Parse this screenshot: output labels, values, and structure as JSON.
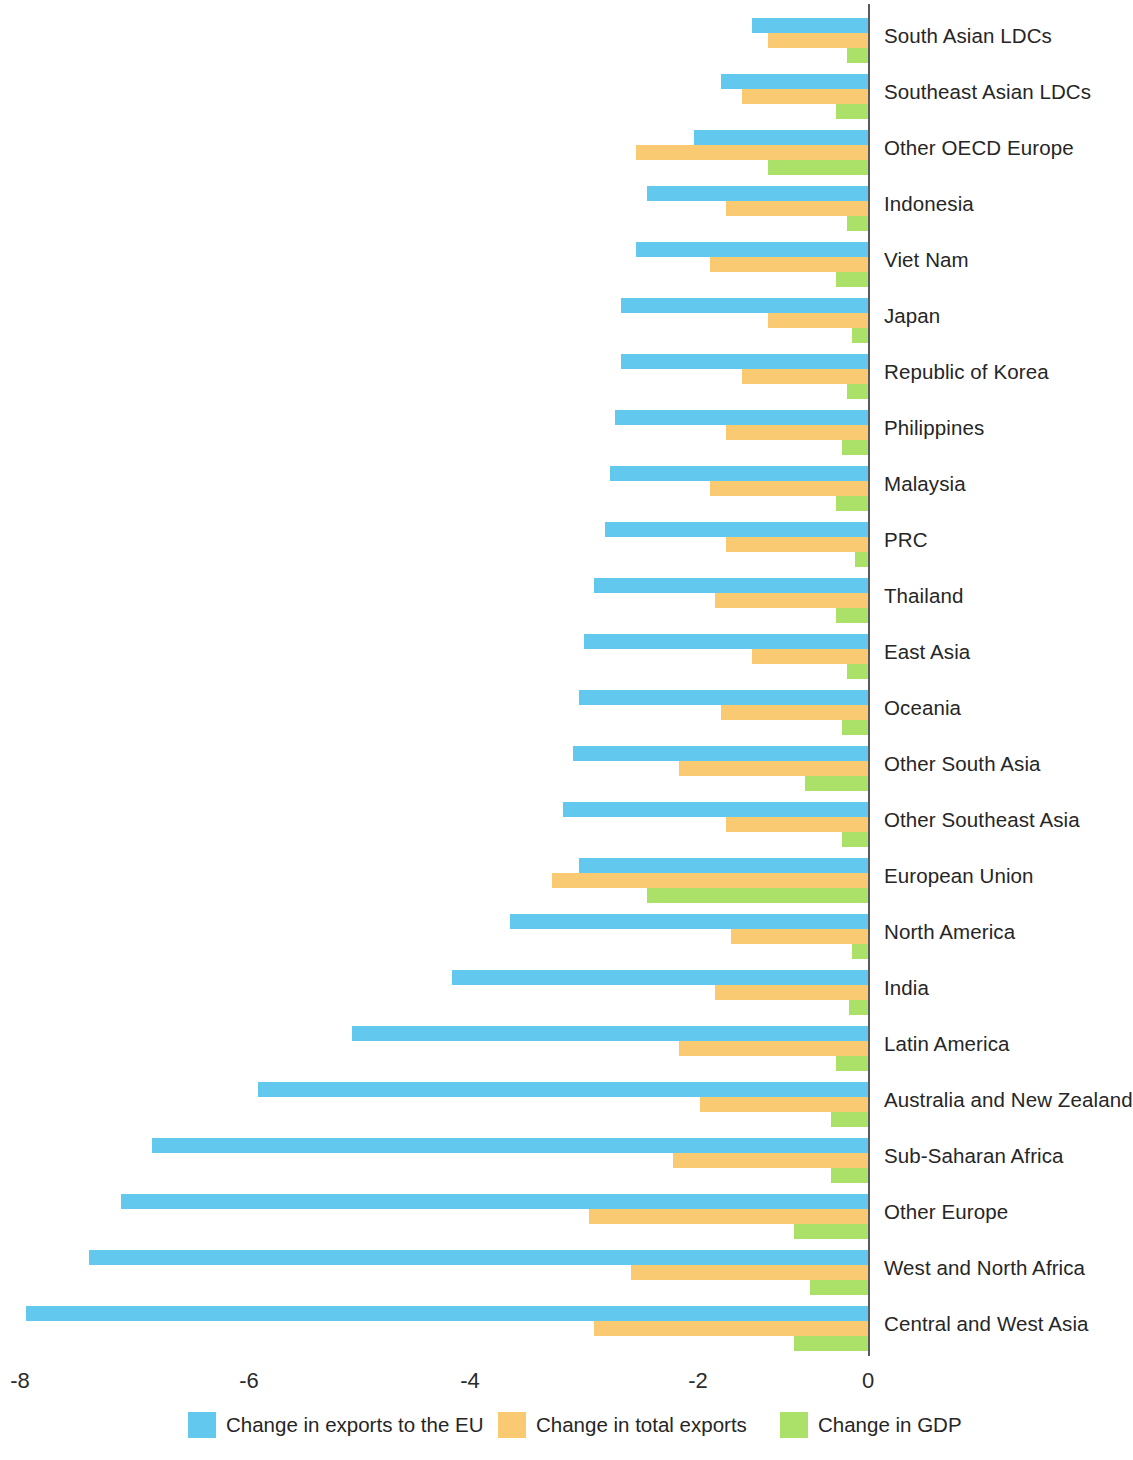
{
  "chart_data": {
    "type": "bar",
    "orientation": "horizontal",
    "title": "",
    "subtitle": "",
    "xlabel": "",
    "ylabel": "",
    "xlim": [
      -8,
      0
    ],
    "xticks": [
      -8,
      -6,
      -4,
      -2,
      0
    ],
    "xtick_labels": [
      "-8",
      "-6",
      "-4",
      "-2",
      "0"
    ],
    "grid": false,
    "legend_position": "bottom",
    "colors": {
      "exports_to_eu": "#63c8ee",
      "total_exports": "#f9ca72",
      "gdp": "#abe168",
      "axis": "#5a5a5a",
      "text": "#262626",
      "background": "#ffffff"
    },
    "categories": [
      "South Asian LDCs",
      "Southeast Asian LDCs",
      "Other OECD Europe",
      "Indonesia",
      "Viet Nam",
      "Japan",
      "Republic of Korea",
      "Philippines",
      "Malaysia",
      "PRC",
      "Thailand",
      "East Asia",
      "Oceania",
      "Other South Asia",
      "Other Southeast Asia",
      "European Union",
      "North America",
      "India",
      "Latin America",
      "Australia and New Zealand",
      "Sub-Saharan Africa",
      "Other Europe",
      "West and North Africa",
      "Central and West Asia"
    ],
    "series": [
      {
        "name": "Change in exports to the EU",
        "color": "#63c8ee",
        "values": [
          -1.1,
          -1.4,
          -1.65,
          -2.1,
          -2.2,
          -2.35,
          -2.35,
          -2.4,
          -2.45,
          -2.5,
          -2.6,
          -2.7,
          -2.75,
          -2.8,
          -2.9,
          -2.75,
          -3.4,
          -3.95,
          -4.9,
          -5.8,
          -6.8,
          -7.1,
          -7.4,
          -8.0
        ]
      },
      {
        "name": "Change in total exports",
        "color": "#f9ca72",
        "values": [
          -0.95,
          -1.2,
          -2.2,
          -1.35,
          -1.5,
          -0.95,
          -1.2,
          -1.35,
          -1.5,
          -1.35,
          -1.45,
          -1.1,
          -1.4,
          -1.8,
          -1.35,
          -3.0,
          -1.3,
          -1.45,
          -1.8,
          -1.6,
          -1.85,
          -2.65,
          -2.25,
          -2.6
        ]
      },
      {
        "name": "Change in GDP",
        "color": "#abe168",
        "values": [
          -0.2,
          -0.3,
          -0.95,
          -0.2,
          -0.3,
          -0.15,
          -0.2,
          -0.25,
          -0.3,
          -0.12,
          -0.3,
          -0.2,
          -0.25,
          -0.6,
          -0.25,
          -2.1,
          -0.15,
          -0.18,
          -0.3,
          -0.35,
          -0.35,
          -0.7,
          -0.55,
          -0.7
        ]
      }
    ]
  },
  "legend": {
    "items": [
      {
        "label": "Change in exports to the EU",
        "color": "#63c8ee"
      },
      {
        "label": "Change in total exports",
        "color": "#f9ca72"
      },
      {
        "label": "Change in GDP",
        "color": "#abe168"
      }
    ]
  }
}
